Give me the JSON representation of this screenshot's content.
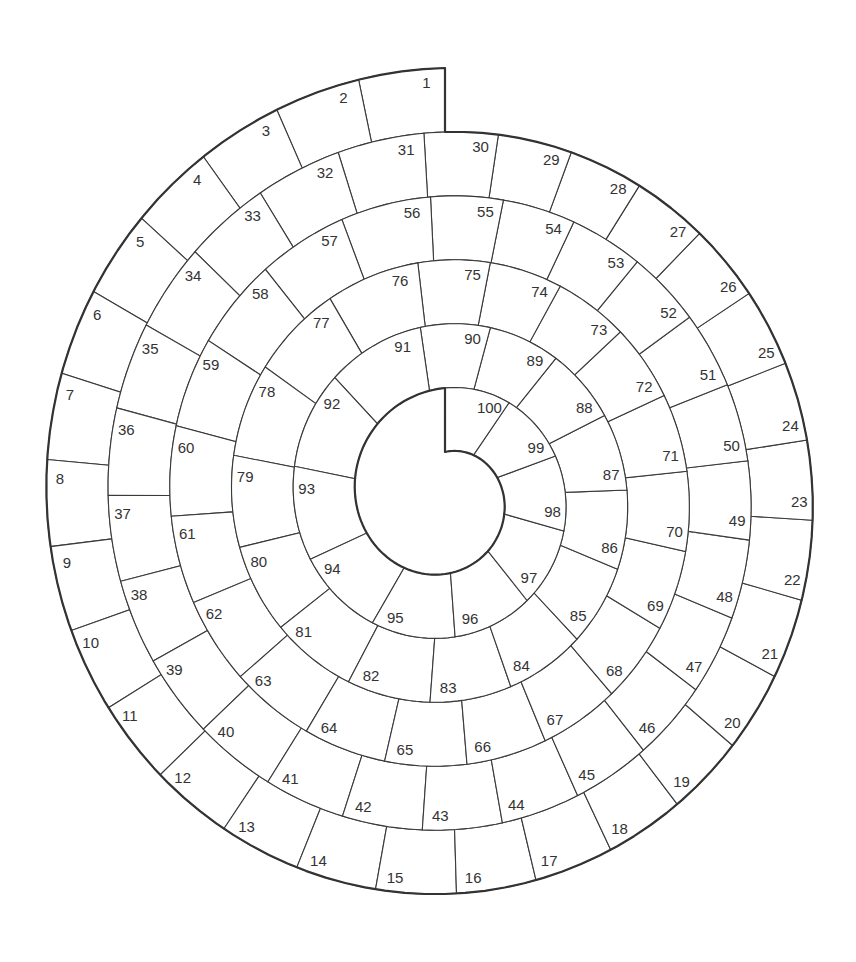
{
  "board": {
    "type": "spiral-track",
    "square_count": 100,
    "first_square": 1,
    "last_square": 100,
    "direction": "counterclockwise-inward",
    "labels": [
      "1",
      "2",
      "3",
      "4",
      "5",
      "6",
      "7",
      "8",
      "9",
      "10",
      "11",
      "12",
      "13",
      "14",
      "15",
      "16",
      "17",
      "18",
      "19",
      "20",
      "21",
      "22",
      "23",
      "24",
      "25",
      "26",
      "27",
      "28",
      "29",
      "30",
      "31",
      "32",
      "33",
      "34",
      "35",
      "36",
      "37",
      "38",
      "39",
      "40",
      "41",
      "42",
      "43",
      "44",
      "45",
      "46",
      "47",
      "48",
      "49",
      "50",
      "51",
      "52",
      "53",
      "54",
      "55",
      "56",
      "57",
      "58",
      "59",
      "60",
      "61",
      "62",
      "63",
      "64",
      "65",
      "66",
      "67",
      "68",
      "69",
      "70",
      "71",
      "72",
      "73",
      "74",
      "75",
      "76",
      "77",
      "78",
      "79",
      "80",
      "81",
      "82",
      "83",
      "84",
      "85",
      "86",
      "87",
      "88",
      "89",
      "90",
      "91",
      "92",
      "93",
      "94",
      "95",
      "96",
      "97",
      "98",
      "99",
      "100"
    ],
    "colors": {
      "line": "#333333",
      "fill": "#ffffff",
      "text": "#333333"
    }
  }
}
